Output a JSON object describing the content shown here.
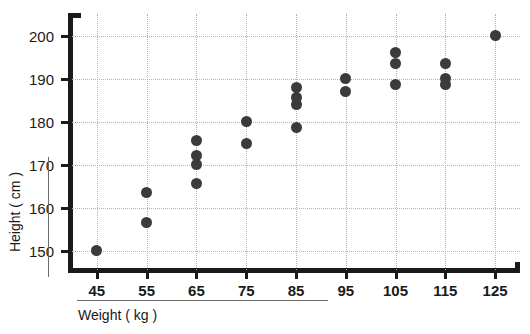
{
  "chart_data": {
    "type": "scatter",
    "title": "",
    "xlabel": "Weight ( kg )",
    "ylabel": "Height ( cm )",
    "xlim": [
      40,
      130
    ],
    "ylim": [
      145,
      205
    ],
    "xticks": [
      45,
      55,
      65,
      75,
      85,
      95,
      105,
      115,
      125
    ],
    "yticks": [
      150,
      160,
      170,
      180,
      190,
      200
    ],
    "xtick_labels": [
      "45",
      "55",
      "65",
      "75",
      "85",
      "95",
      "105",
      "115",
      "125"
    ],
    "ytick_labels": [
      "150",
      "160",
      "170",
      "180",
      "190",
      "200"
    ],
    "grid": true,
    "grid_style": "dotted",
    "legend": "none",
    "marker_color": "#3b3b3b",
    "grid_color": "#b4b4b4",
    "axis_color": "#1a1a1a",
    "points": [
      {
        "x": 45,
        "y": 150.0
      },
      {
        "x": 55,
        "y": 163.5
      },
      {
        "x": 55,
        "y": 156.5
      },
      {
        "x": 65,
        "y": 175.5
      },
      {
        "x": 65,
        "y": 172.0
      },
      {
        "x": 65,
        "y": 170.0
      },
      {
        "x": 65,
        "y": 165.5
      },
      {
        "x": 75,
        "y": 180.0
      },
      {
        "x": 75,
        "y": 175.0
      },
      {
        "x": 85,
        "y": 188.0
      },
      {
        "x": 85,
        "y": 185.5
      },
      {
        "x": 85,
        "y": 184.0
      },
      {
        "x": 85,
        "y": 178.5
      },
      {
        "x": 95,
        "y": 190.0
      },
      {
        "x": 95,
        "y": 187.0
      },
      {
        "x": 105,
        "y": 196.0
      },
      {
        "x": 105,
        "y": 193.5
      },
      {
        "x": 105,
        "y": 188.5
      },
      {
        "x": 115,
        "y": 193.5
      },
      {
        "x": 115,
        "y": 190.0
      },
      {
        "x": 115,
        "y": 188.5
      },
      {
        "x": 125,
        "y": 200.0
      }
    ]
  }
}
